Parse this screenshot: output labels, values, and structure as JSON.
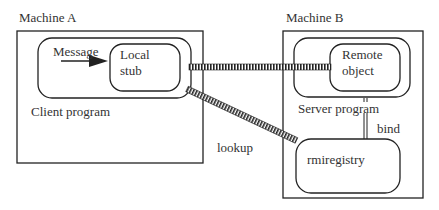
{
  "diagram": {
    "machine_a": {
      "label": "Machine A"
    },
    "machine_b": {
      "label": "Machine B"
    },
    "client_program": {
      "label": "Client program"
    },
    "local_stub": {
      "line1": "Local",
      "line2": "stub"
    },
    "message": {
      "label": "Message"
    },
    "server_program": {
      "label": "Server program"
    },
    "remote_object": {
      "line1": "Remote",
      "line2": "object"
    },
    "rmiregistry": {
      "label": "rmiregistry"
    },
    "lookup": {
      "label": "lookup"
    },
    "bind": {
      "label": "bind"
    }
  }
}
